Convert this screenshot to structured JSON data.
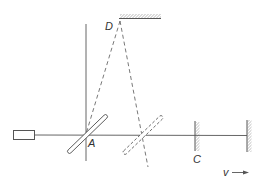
{
  "diagram": {
    "type": "interferometer-schematic",
    "labels": {
      "mirror_top": "D",
      "beam_splitter": "A",
      "mirror_c": "C",
      "velocity": "v"
    },
    "elements": [
      {
        "id": "source",
        "kind": "light-source-box"
      },
      {
        "id": "beam",
        "kind": "horizontal-light-path"
      },
      {
        "id": "vertical-axis",
        "kind": "vertical-line"
      },
      {
        "id": "mirror-d",
        "kind": "hatched-mirror",
        "orientation": "horizontal"
      },
      {
        "id": "beam-splitter-a",
        "kind": "half-silvered-plate",
        "style": "solid"
      },
      {
        "id": "beam-splitter-moved",
        "kind": "half-silvered-plate",
        "style": "dashed"
      },
      {
        "id": "mirror-c",
        "kind": "hatched-mirror",
        "orientation": "vertical"
      },
      {
        "id": "mirror-end",
        "kind": "hatched-mirror",
        "orientation": "vertical"
      },
      {
        "id": "ray-d-to-a",
        "kind": "dashed-ray"
      },
      {
        "id": "ray-d-to-moved",
        "kind": "dashed-ray"
      },
      {
        "id": "velocity-arrow",
        "kind": "arrow",
        "direction": "right"
      }
    ],
    "colors": {
      "line": "#555555",
      "hatch": "#666666",
      "text": "#333333",
      "background": "#ffffff"
    }
  }
}
